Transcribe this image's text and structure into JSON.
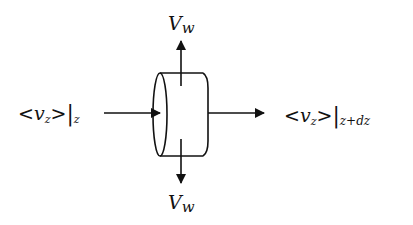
{
  "diagram": {
    "labels": {
      "top_velocity": {
        "main": "V",
        "sub": "w"
      },
      "bottom_velocity": {
        "main": "V",
        "sub": "w"
      },
      "inlet": {
        "left_bracket": "<",
        "main": "v",
        "sub": "z",
        "right_bracket": ">",
        "bar": "|",
        "eval": "z"
      },
      "outlet": {
        "left_bracket": "<",
        "main": "v",
        "sub": "z",
        "right_bracket": ">",
        "bar": "|",
        "eval": "z+dz"
      }
    },
    "nodes": [
      {
        "id": "cylinder-element",
        "shape": "cylinder",
        "orientation": "horizontal"
      }
    ],
    "edges": [
      {
        "id": "inlet-flow",
        "direction": "right",
        "to": "cylinder-element",
        "label": "<v_z>|_z"
      },
      {
        "id": "outlet-flow",
        "direction": "right",
        "from": "cylinder-element",
        "label": "<v_z>|_{z+dz}"
      },
      {
        "id": "wall-flow-up",
        "direction": "up",
        "from": "cylinder-element",
        "label": "V_w"
      },
      {
        "id": "wall-flow-down",
        "direction": "down",
        "from": "cylinder-element",
        "label": "V_w"
      }
    ],
    "colors": {
      "ink": "#111111",
      "background": "#ffffff"
    }
  }
}
